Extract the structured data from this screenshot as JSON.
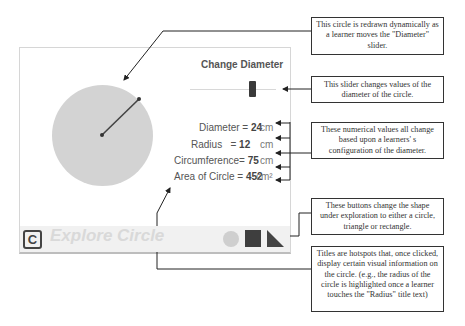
{
  "app": {
    "title": "Explore Circle",
    "logo_letter": "C",
    "slider_title": "Change Diameter",
    "slider": {
      "value": 24,
      "min_label": "",
      "max_label": ""
    },
    "values": [
      {
        "label": "Diameter",
        "value": "24",
        "unit": "cm"
      },
      {
        "label": "Radius",
        "value": "12",
        "unit": "cm"
      },
      {
        "label": "Circumference",
        "value": "75",
        "unit": "cm"
      },
      {
        "label": "Area of Circle",
        "value": "452",
        "unit": "cm²"
      }
    ],
    "shape_buttons": [
      {
        "name": "circle",
        "color": "#cfcfcf"
      },
      {
        "name": "rectangle",
        "color": "#3e3e3e"
      },
      {
        "name": "triangle",
        "color": "#444444"
      }
    ]
  },
  "callouts": [
    {
      "text": "This circle is redrawn dynamically as a learner moves the \"Diameter\" slider."
    },
    {
      "text": "This slider changes values of the diameter of the circle."
    },
    {
      "text": "These numerical values all change based upon a learners' s configuration of the diameter."
    },
    {
      "text": "These buttons change the shape under exploration to either a circle, triangle or rectangle."
    },
    {
      "text": "Titles are hotspots that, once clicked, display certain visual information on the circle. (e.g., the radius of the circle is highlighted once a learner touches the \"Radius\" title text)"
    }
  ]
}
